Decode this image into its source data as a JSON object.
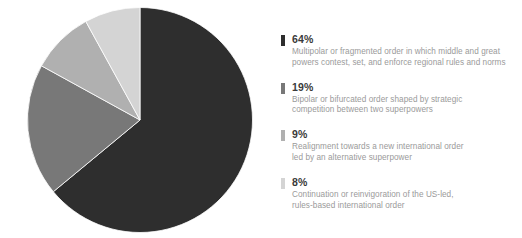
{
  "chart_data": {
    "type": "pie",
    "title": "",
    "subtitle": "",
    "xlabel": "",
    "ylabel": "",
    "legend_position": "right",
    "grid": false,
    "start_angle_deg": 0,
    "direction": "clockwise",
    "categories": [
      "Multipolar or fragmented order in which middle and great powers contest, set, and enforce regional rules and norms",
      "Bipolar or bifurcated order shaped by strategic competition between two superpowers",
      "Realignment towards a new international order led by an alternative superpower",
      "Continuation or reinvigoration of the US-led, rules-based international order"
    ],
    "values": [
      64,
      19,
      9,
      8
    ],
    "value_labels": [
      "64%",
      "19%",
      "9%",
      "8%"
    ],
    "colors": [
      "#2e2e2e",
      "#787878",
      "#b0b0b0",
      "#d4d4d4"
    ],
    "units": "percent"
  },
  "pie": {
    "slices": [
      {
        "label": "64%",
        "value": 64,
        "color": "#2e2e2e"
      },
      {
        "label": "19%",
        "value": 19,
        "color": "#787878"
      },
      {
        "label": "9%",
        "value": 9,
        "color": "#b0b0b0"
      },
      {
        "label": "8%",
        "value": 8,
        "color": "#d4d4d4"
      }
    ]
  },
  "legend": {
    "items": [
      {
        "percent": "64%",
        "description": "Multipolar or fragmented order in which middle and great\npowers contest, set, and enforce regional rules and norms",
        "color": "#2e2e2e"
      },
      {
        "percent": "19%",
        "description": "Bipolar or bifurcated order shaped by strategic\ncompetition between two superpowers",
        "color": "#787878"
      },
      {
        "percent": "9%",
        "description": "Realignment towards a new international order\nled by an alternative superpower",
        "color": "#b0b0b0"
      },
      {
        "percent": "8%",
        "description": "Continuation or reinvigoration of the US-led,\nrules-based international order",
        "color": "#d4d4d4"
      }
    ]
  }
}
